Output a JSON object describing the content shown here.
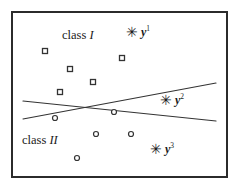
{
  "figure": {
    "title": "",
    "width": 240,
    "height": 191,
    "background": "#ffffff",
    "border_color": "#2b2b2b"
  },
  "labels": {
    "class_one": {
      "prefix": "class ",
      "numeral": "I",
      "x": 62,
      "y": 28
    },
    "class_two": {
      "prefix": "class ",
      "numeral": "II",
      "x": 22,
      "y": 133
    },
    "y1": {
      "star": "✳",
      "name": "y",
      "sup": "1",
      "x": 126,
      "y": 24
    },
    "y2": {
      "star": "✳",
      "name": "y",
      "sup": "2",
      "x": 160,
      "y": 92
    },
    "y3": {
      "star": "✳",
      "name": "y",
      "sup": "3",
      "x": 150,
      "y": 141
    }
  },
  "chart_data": {
    "type": "scatter",
    "title": "",
    "xlabel": "",
    "ylabel": "",
    "xlim": [
      0,
      240
    ],
    "ylim": [
      0,
      191
    ],
    "grid": false,
    "legend": "none",
    "axes_visible": false,
    "note": "Two-class pattern with two crossing linear decision boundaries and three prototype vectors y1, y2, y3.",
    "series": [
      {
        "name": "class I",
        "marker": "square",
        "marker_size": 5,
        "marker_fill": "#ffffff",
        "marker_stroke": "#333333",
        "points": [
          {
            "x": 45,
            "y": 51
          },
          {
            "x": 122,
            "y": 58
          },
          {
            "x": 70,
            "y": 69
          },
          {
            "x": 93,
            "y": 82
          },
          {
            "x": 60,
            "y": 92
          }
        ]
      },
      {
        "name": "class II",
        "marker": "circle",
        "marker_size": 5,
        "marker_fill": "#ffffff",
        "marker_stroke": "#333333",
        "points": [
          {
            "x": 55,
            "y": 118
          },
          {
            "x": 114,
            "y": 112
          },
          {
            "x": 96,
            "y": 134
          },
          {
            "x": 131,
            "y": 134
          },
          {
            "x": 77,
            "y": 158
          }
        ]
      },
      {
        "name": "prototypes",
        "marker": "asterisk",
        "marker_size": 7,
        "marker_stroke": "#1a1a1a",
        "points": [
          {
            "x": 129,
            "y": 30,
            "label": "y1"
          },
          {
            "x": 163,
            "y": 98,
            "label": "y2"
          },
          {
            "x": 153,
            "y": 147,
            "label": "y3"
          }
        ]
      }
    ],
    "lines": [
      {
        "name": "boundary-1",
        "description": "rises to the right",
        "x1": 23,
        "y1": 119,
        "x2": 216,
        "y2": 83,
        "stroke": "#333333",
        "stroke_width": 1.2
      },
      {
        "name": "boundary-2",
        "description": "falls to the right",
        "x1": 23,
        "y1": 101,
        "x2": 216,
        "y2": 121,
        "stroke": "#333333",
        "stroke_width": 1.2
      }
    ],
    "intersection": {
      "x": 85,
      "y": 110
    }
  }
}
